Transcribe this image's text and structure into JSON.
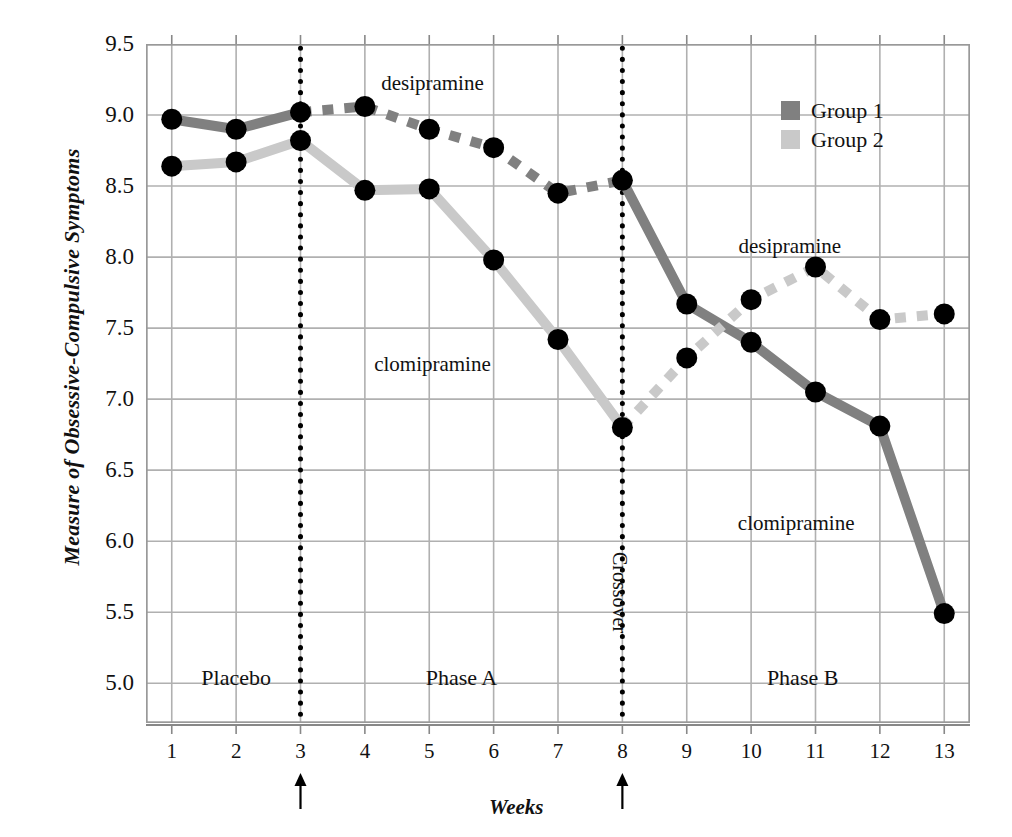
{
  "chart_data": {
    "type": "line",
    "title": "",
    "xlabel": "Weeks",
    "ylabel": "Measure of Obsessive-Compulsive Symptoms",
    "xlim": [
      0.6,
      13.4
    ],
    "ylim": [
      4.72,
      9.5
    ],
    "grid": true,
    "x": [
      1,
      2,
      3,
      4,
      5,
      6,
      7,
      8,
      9,
      10,
      11,
      12,
      13
    ],
    "xticklabels": [
      "1",
      "2",
      "3",
      "4",
      "5",
      "6",
      "7",
      "8",
      "9",
      "10",
      "11",
      "12",
      "13"
    ],
    "yticklabels": [
      "9.5",
      "9.0",
      "8.5",
      "8.0",
      "7.5",
      "7.0",
      "6.5",
      "6.0",
      "5.5",
      "5.0"
    ],
    "yticks": [
      9.5,
      9.0,
      8.5,
      8.0,
      7.5,
      7.0,
      6.5,
      6.0,
      5.5,
      5.0
    ],
    "legend_position": "top-right",
    "series": [
      {
        "name": "Group 1",
        "color": "#808080",
        "segments": [
          {
            "style": "solid",
            "drug": "",
            "points": [
              [
                1,
                8.97
              ],
              [
                2,
                8.9
              ],
              [
                3,
                9.02
              ]
            ]
          },
          {
            "style": "dashed",
            "drug": "desipramine",
            "points": [
              [
                3,
                9.02
              ],
              [
                4,
                9.06
              ],
              [
                5,
                8.9
              ],
              [
                6,
                8.77
              ],
              [
                7,
                8.45
              ],
              [
                8,
                8.54
              ]
            ]
          },
          {
            "style": "solid",
            "drug": "clomipramine",
            "points": [
              [
                8,
                8.54
              ],
              [
                9,
                7.67
              ],
              [
                10,
                7.4
              ],
              [
                11,
                7.05
              ],
              [
                12,
                6.81
              ],
              [
                13,
                5.49
              ]
            ]
          }
        ]
      },
      {
        "name": "Group 2",
        "color": "#c9c9c9",
        "segments": [
          {
            "style": "solid",
            "drug": "",
            "points": [
              [
                1,
                8.64
              ],
              [
                2,
                8.67
              ],
              [
                3,
                8.82
              ]
            ]
          },
          {
            "style": "solid",
            "drug": "clomipramine",
            "points": [
              [
                3,
                8.82
              ],
              [
                4,
                8.47
              ],
              [
                5,
                8.48
              ],
              [
                6,
                7.98
              ],
              [
                7,
                7.42
              ],
              [
                8,
                6.8
              ]
            ]
          },
          {
            "style": "dashed",
            "drug": "desipramine",
            "points": [
              [
                8,
                6.8
              ],
              [
                9,
                7.29
              ],
              [
                10,
                7.7
              ],
              [
                11,
                7.93
              ],
              [
                12,
                7.56
              ],
              [
                13,
                7.6
              ]
            ]
          }
        ]
      }
    ],
    "annotations": [
      {
        "text": "desipramine",
        "x": 5.05,
        "y": 9.22
      },
      {
        "text": "clomipramine",
        "x": 5.05,
        "y": 7.24
      },
      {
        "text": "desipramine",
        "x": 10.6,
        "y": 8.07
      },
      {
        "text": "clomipramine",
        "x": 10.7,
        "y": 6.12
      }
    ],
    "phase_labels": [
      {
        "text": "Placebo",
        "x": 2.0
      },
      {
        "text": "Phase A",
        "x": 5.5
      },
      {
        "text": "Phase B",
        "x": 10.8
      }
    ],
    "vlines": [
      {
        "x": 3,
        "style": "dotted",
        "label": ""
      },
      {
        "x": 8,
        "style": "dotted",
        "label": "Crossover"
      }
    ],
    "axis_arrows": [
      3,
      8
    ]
  },
  "legend": {
    "items": [
      {
        "label": "Group 1",
        "color": "#808080"
      },
      {
        "label": "Group 2",
        "color": "#c9c9c9"
      }
    ]
  }
}
